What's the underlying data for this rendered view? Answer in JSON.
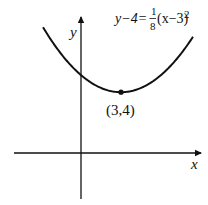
{
  "figure": {
    "equation": {
      "lhs": "y−4=",
      "frac_num": "1",
      "frac_den": "8",
      "rhs": "(x−3)",
      "exponent": "2"
    },
    "vertex_label": "(3,4)",
    "x_axis_label": "x",
    "y_axis_label": "y",
    "colors": {
      "ink": "#111111",
      "background": "#ffffff"
    }
  },
  "chart_data": {
    "type": "line",
    "function": {
      "a": 0.125,
      "h": 3,
      "k": 4
    },
    "vertex": {
      "x": 3,
      "y": 4,
      "label": "(3,4)"
    },
    "x_range": [
      -3,
      9
    ],
    "xlabel": "x",
    "ylabel": "y",
    "grid": false
  }
}
